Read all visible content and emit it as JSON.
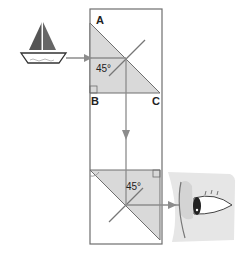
{
  "diagram": {
    "type": "periscope-prism",
    "labels": {
      "vertex_a": "A",
      "vertex_b": "B",
      "vertex_c": "C"
    },
    "angles": {
      "top_prism": "45°",
      "bottom_prism": "45°"
    },
    "elements": {
      "object": "sailboat",
      "observer": "eye"
    },
    "colors": {
      "prism_fill": "#d9d9d9",
      "outline": "#6e6e6e",
      "ray": "#8c8c8c",
      "sail": "#555555",
      "face_fill": "#e6e6e6"
    }
  }
}
